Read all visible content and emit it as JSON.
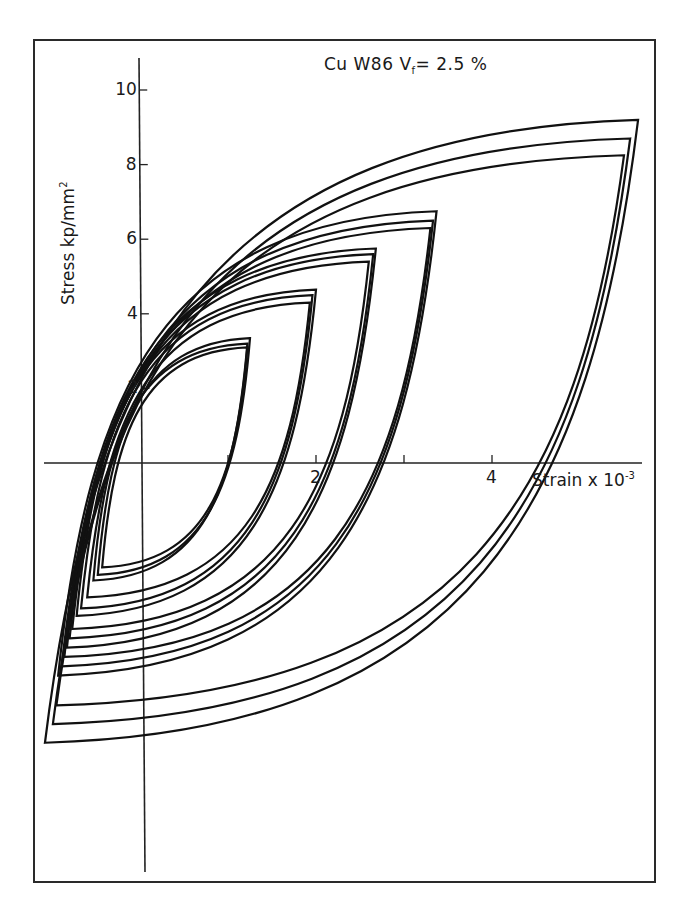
{
  "chart_data": {
    "type": "line",
    "title_parts": {
      "main": "Cu W86 V",
      "sub": "f",
      "rest": "= 2.5 %"
    },
    "xlabel": "Strain x 10^-3",
    "xlabel_parts": {
      "main": "Strain x 10",
      "sup": "-3"
    },
    "ylabel": "Stress kp/mm^2",
    "ylabel_parts": {
      "main": "Stress  kp/mm",
      "sup": "2"
    },
    "xlim": [
      -1.1,
      5.8
    ],
    "ylim": [
      -10.9,
      10.9
    ],
    "x_ticks": [
      1,
      2,
      3,
      4
    ],
    "x_tick_labels": [
      "",
      "2",
      "",
      "4"
    ],
    "y_ticks": [
      2,
      4,
      6,
      8,
      10
    ],
    "y_tick_labels": [
      "2",
      "4",
      "6",
      "8",
      "10"
    ],
    "grid": false,
    "legend": null,
    "series": [
      {
        "name": "loop 1",
        "top": [
          1.22,
          3.1
        ],
        "bottom": [
          -0.43,
          -2.8
        ]
      },
      {
        "name": "loop 2",
        "top": [
          1.25,
          3.35
        ],
        "bottom": [
          -0.48,
          -3.0
        ]
      },
      {
        "name": "loop 3",
        "top": [
          1.22,
          3.2
        ],
        "bottom": [
          -0.53,
          -3.15
        ]
      },
      {
        "name": "loop 4",
        "top": [
          1.93,
          4.3
        ],
        "bottom": [
          -0.6,
          -3.6
        ]
      },
      {
        "name": "loop 5",
        "top": [
          1.96,
          4.5
        ],
        "bottom": [
          -0.67,
          -3.9
        ]
      },
      {
        "name": "loop 6",
        "top": [
          2.0,
          4.65
        ],
        "bottom": [
          -0.72,
          -4.1
        ]
      },
      {
        "name": "loop 7",
        "top": [
          2.6,
          5.4
        ],
        "bottom": [
          -0.77,
          -4.45
        ]
      },
      {
        "name": "loop 8",
        "top": [
          2.65,
          5.6
        ],
        "bottom": [
          -0.8,
          -4.7
        ]
      },
      {
        "name": "loop 9",
        "top": [
          2.68,
          5.75
        ],
        "bottom": [
          -0.83,
          -4.95
        ]
      },
      {
        "name": "loop 10",
        "top": [
          3.3,
          6.3
        ],
        "bottom": [
          -0.86,
          -5.2
        ]
      },
      {
        "name": "loop 11",
        "top": [
          3.33,
          6.5
        ],
        "bottom": [
          -0.89,
          -5.45
        ]
      },
      {
        "name": "loop 12",
        "top": [
          3.37,
          6.75
        ],
        "bottom": [
          -0.93,
          -5.7
        ]
      },
      {
        "name": "loop 13",
        "top": [
          5.5,
          8.25
        ],
        "bottom": [
          -0.95,
          -6.5
        ]
      },
      {
        "name": "loop 14",
        "top": [
          5.57,
          8.7
        ],
        "bottom": [
          -0.99,
          -7.0
        ]
      },
      {
        "name": "loop 15",
        "top": [
          5.66,
          9.2
        ],
        "bottom": [
          -1.08,
          -7.5
        ]
      }
    ]
  },
  "layout": {
    "origin_px": [
      140,
      463
    ],
    "px_per_strain": 88,
    "px_per_stress": 37.3,
    "line_color": "#111111",
    "axis_color": "#222222"
  }
}
